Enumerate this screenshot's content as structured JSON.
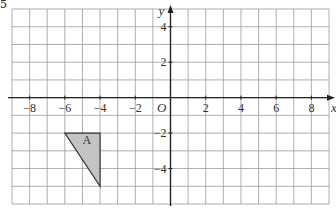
{
  "question_number": "5",
  "graph": {
    "x_axis_label": "x",
    "y_axis_label": "y",
    "origin_label": "O",
    "x_range": [
      -9,
      9
    ],
    "y_range": [
      -6,
      5
    ],
    "x_ticks": [
      {
        "value": -8,
        "label": "−8"
      },
      {
        "value": -6,
        "label": "−6"
      },
      {
        "value": -4,
        "label": "−4"
      },
      {
        "value": -2,
        "label": "−2"
      },
      {
        "value": 2,
        "label": "2"
      },
      {
        "value": 4,
        "label": "4"
      },
      {
        "value": 6,
        "label": "6"
      },
      {
        "value": 8,
        "label": "8"
      }
    ],
    "y_ticks": [
      {
        "value": 4,
        "label": "4"
      },
      {
        "value": 2,
        "label": "2"
      },
      {
        "value": -2,
        "label": "−2"
      },
      {
        "value": -4,
        "label": "−4"
      }
    ],
    "shape": {
      "label": "A",
      "vertices": [
        [
          -6,
          -2
        ],
        [
          -4,
          -2
        ],
        [
          -4,
          -5
        ]
      ],
      "fill": "#c4c4c4",
      "stroke": "#333333"
    },
    "colors": {
      "grid": "#9a9a9a",
      "axis": "#222222"
    }
  }
}
